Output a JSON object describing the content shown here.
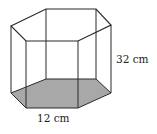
{
  "figure": {
    "shape": "hexagonal prism",
    "base_shading_color": "#a8a8a8",
    "edge_color": "#2a2a2a",
    "labels": {
      "height": "32 cm",
      "base_edge": "12 cm"
    }
  }
}
